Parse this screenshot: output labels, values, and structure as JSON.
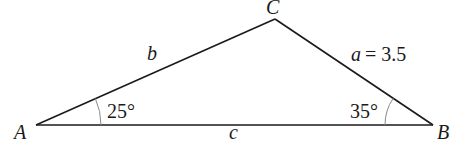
{
  "diagram": {
    "type": "triangle",
    "vertices": {
      "A": {
        "label": "A"
      },
      "B": {
        "label": "B"
      },
      "C": {
        "label": "C"
      }
    },
    "sides": {
      "a": {
        "label": "a",
        "value_text": "= 3.5"
      },
      "b": {
        "label": "b"
      },
      "c": {
        "label": "c"
      }
    },
    "angles": {
      "A": {
        "label": "25°"
      },
      "B": {
        "label": "35°"
      }
    },
    "colors": {
      "line": "#1a1a1a",
      "arc": "#8a8a8a",
      "background": "#ffffff"
    }
  }
}
